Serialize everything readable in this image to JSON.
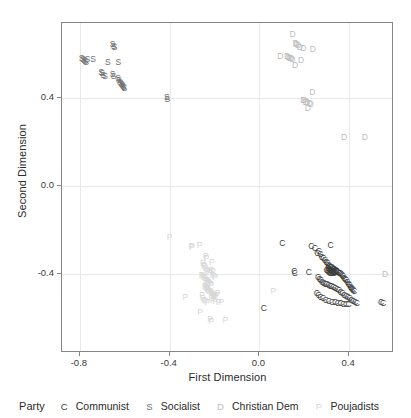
{
  "chart_data": {
    "type": "scatter",
    "title": "",
    "xlabel": "First Dimension",
    "ylabel": "Second Dimension",
    "xlim": [
      -0.88,
      0.6
    ],
    "ylim": [
      -0.76,
      0.74
    ],
    "xticks": [
      -0.8,
      -0.4,
      0.0,
      0.4
    ],
    "xticklabels": [
      "-0.8",
      "-0.4",
      "0.0",
      "0.4"
    ],
    "yticks": [
      0.4,
      0.0,
      -0.4
    ],
    "yticklabels": [
      "0.4",
      "0.0",
      "-0.4"
    ],
    "grid": true,
    "legend_position": "bottom",
    "legend_title": "Party",
    "series": [
      {
        "name": "Communist",
        "key": "C",
        "color": "#3c3c3c",
        "points": [
          [
            0.102,
            -0.262
          ],
          [
            0.317,
            -0.271
          ],
          [
            0.232,
            -0.273
          ],
          [
            0.247,
            -0.283
          ],
          [
            0.265,
            -0.296
          ],
          [
            0.258,
            -0.305
          ],
          [
            0.272,
            -0.311
          ],
          [
            0.278,
            -0.322
          ],
          [
            0.285,
            -0.33
          ],
          [
            0.292,
            -0.337
          ],
          [
            0.298,
            -0.344
          ],
          [
            0.303,
            -0.352
          ],
          [
            0.308,
            -0.358
          ],
          [
            0.313,
            -0.363
          ],
          [
            0.318,
            -0.367
          ],
          [
            0.322,
            -0.371
          ],
          [
            0.326,
            -0.374
          ],
          [
            0.33,
            -0.377
          ],
          [
            0.333,
            -0.379
          ],
          [
            0.336,
            -0.381
          ],
          [
            0.339,
            -0.383
          ],
          [
            0.341,
            -0.385
          ],
          [
            0.344,
            -0.386
          ],
          [
            0.306,
            -0.372
          ],
          [
            0.311,
            -0.377
          ],
          [
            0.315,
            -0.381
          ],
          [
            0.319,
            -0.384
          ],
          [
            0.323,
            -0.387
          ],
          [
            0.327,
            -0.389
          ],
          [
            0.331,
            -0.39
          ],
          [
            0.335,
            -0.391
          ],
          [
            0.338,
            -0.392
          ],
          [
            0.3,
            -0.384
          ],
          [
            0.305,
            -0.388
          ],
          [
            0.31,
            -0.392
          ],
          [
            0.315,
            -0.395
          ],
          [
            0.32,
            -0.397
          ],
          [
            0.326,
            -0.398
          ],
          [
            0.332,
            -0.398
          ],
          [
            0.345,
            -0.389
          ],
          [
            0.35,
            -0.391
          ],
          [
            0.355,
            -0.394
          ],
          [
            0.36,
            -0.398
          ],
          [
            0.364,
            -0.402
          ],
          [
            0.368,
            -0.407
          ],
          [
            0.372,
            -0.412
          ],
          [
            0.377,
            -0.418
          ],
          [
            0.382,
            -0.424
          ],
          [
            0.387,
            -0.43
          ],
          [
            0.392,
            -0.437
          ],
          [
            0.397,
            -0.444
          ],
          [
            0.402,
            -0.451
          ],
          [
            0.406,
            -0.458
          ],
          [
            0.41,
            -0.463
          ],
          [
            0.414,
            -0.468
          ],
          [
            0.418,
            -0.472
          ],
          [
            0.422,
            -0.476
          ],
          [
            0.156,
            -0.388
          ],
          [
            0.158,
            -0.397
          ],
          [
            0.22,
            -0.393
          ],
          [
            0.262,
            -0.415
          ],
          [
            0.268,
            -0.423
          ],
          [
            0.274,
            -0.43
          ],
          [
            0.28,
            -0.436
          ],
          [
            0.287,
            -0.441
          ],
          [
            0.294,
            -0.444
          ],
          [
            0.301,
            -0.447
          ],
          [
            0.308,
            -0.45
          ],
          [
            0.315,
            -0.453
          ],
          [
            0.322,
            -0.456
          ],
          [
            0.33,
            -0.459
          ],
          [
            0.338,
            -0.463
          ],
          [
            0.346,
            -0.468
          ],
          [
            0.354,
            -0.474
          ],
          [
            0.362,
            -0.481
          ],
          [
            0.37,
            -0.488
          ],
          [
            0.378,
            -0.495
          ],
          [
            0.386,
            -0.501
          ],
          [
            0.394,
            -0.507
          ],
          [
            0.402,
            -0.512
          ],
          [
            0.41,
            -0.517
          ],
          [
            0.418,
            -0.522
          ],
          [
            0.426,
            -0.527
          ],
          [
            0.434,
            -0.532
          ],
          [
            0.256,
            -0.487
          ],
          [
            0.264,
            -0.496
          ],
          [
            0.273,
            -0.504
          ],
          [
            0.284,
            -0.512
          ],
          [
            0.296,
            -0.518
          ],
          [
            0.31,
            -0.524
          ],
          [
            0.324,
            -0.528
          ],
          [
            0.337,
            -0.53
          ],
          [
            0.35,
            -0.532
          ],
          [
            0.362,
            -0.534
          ],
          [
            0.374,
            -0.536
          ],
          [
            0.386,
            -0.537
          ],
          [
            0.398,
            -0.538
          ],
          [
            0.542,
            -0.53
          ],
          [
            0.552,
            -0.531
          ],
          [
            0.02,
            -0.555
          ]
        ]
      },
      {
        "name": "Socialist",
        "key": "S",
        "color": "#6e6e6e",
        "points": [
          [
            -0.655,
            0.645
          ],
          [
            -0.65,
            0.636
          ],
          [
            -0.645,
            0.63
          ],
          [
            -0.792,
            0.582
          ],
          [
            -0.787,
            0.576
          ],
          [
            -0.782,
            0.57
          ],
          [
            -0.777,
            0.566
          ],
          [
            -0.772,
            0.562
          ],
          [
            -0.767,
            0.575
          ],
          [
            -0.742,
            0.575
          ],
          [
            -0.676,
            0.565
          ],
          [
            -0.629,
            0.563
          ],
          [
            -0.706,
            0.519
          ],
          [
            -0.701,
            0.511
          ],
          [
            -0.696,
            0.505
          ],
          [
            -0.688,
            0.499
          ],
          [
            -0.654,
            0.51
          ],
          [
            -0.65,
            0.5
          ],
          [
            -0.63,
            0.492
          ],
          [
            -0.627,
            0.483
          ],
          [
            -0.622,
            0.474
          ],
          [
            -0.618,
            0.468
          ],
          [
            -0.614,
            0.463
          ],
          [
            -0.611,
            0.458
          ],
          [
            -0.608,
            0.453
          ],
          [
            -0.605,
            0.449
          ],
          [
            -0.602,
            0.445
          ],
          [
            -0.413,
            0.402
          ],
          [
            -0.41,
            0.396
          ]
        ]
      },
      {
        "name": "Christian Dem",
        "key": "D",
        "color": "#bdbdbd",
        "points": [
          [
            0.148,
            0.69
          ],
          [
            0.162,
            0.65
          ],
          [
            0.166,
            0.643
          ],
          [
            0.172,
            0.638
          ],
          [
            0.18,
            0.632
          ],
          [
            0.196,
            0.627
          ],
          [
            0.238,
            0.62
          ],
          [
            0.093,
            0.589
          ],
          [
            0.124,
            0.59
          ],
          [
            0.13,
            0.586
          ],
          [
            0.136,
            0.582
          ],
          [
            0.141,
            0.58
          ],
          [
            0.147,
            0.578
          ],
          [
            0.186,
            0.57
          ],
          [
            0.159,
            0.548
          ],
          [
            0.236,
            0.425
          ],
          [
            0.196,
            0.392
          ],
          [
            0.202,
            0.388
          ],
          [
            0.206,
            0.383
          ],
          [
            0.212,
            0.38
          ],
          [
            0.224,
            0.378
          ],
          [
            0.229,
            0.374
          ],
          [
            0.216,
            0.356
          ],
          [
            0.378,
            0.221
          ],
          [
            0.47,
            0.222
          ],
          [
            0.56,
            -0.402
          ]
        ]
      },
      {
        "name": "Poujadists",
        "key": "P",
        "color": "#d6d6d6",
        "points": [
          [
            -0.4,
            -0.232
          ],
          [
            -0.303,
            -0.272
          ],
          [
            -0.3,
            -0.276
          ],
          [
            -0.266,
            -0.271
          ],
          [
            -0.24,
            -0.318
          ],
          [
            -0.236,
            -0.326
          ],
          [
            -0.252,
            -0.35
          ],
          [
            -0.248,
            -0.358
          ],
          [
            -0.244,
            -0.364
          ],
          [
            -0.212,
            -0.344
          ],
          [
            -0.24,
            -0.372
          ],
          [
            -0.236,
            -0.382
          ],
          [
            -0.23,
            -0.389
          ],
          [
            -0.222,
            -0.393
          ],
          [
            -0.214,
            -0.382
          ],
          [
            -0.206,
            -0.385
          ],
          [
            -0.258,
            -0.404
          ],
          [
            -0.252,
            -0.41
          ],
          [
            -0.246,
            -0.416
          ],
          [
            -0.242,
            -0.421
          ],
          [
            -0.238,
            -0.426
          ],
          [
            -0.234,
            -0.43
          ],
          [
            -0.23,
            -0.434
          ],
          [
            -0.226,
            -0.438
          ],
          [
            -0.222,
            -0.442
          ],
          [
            -0.218,
            -0.446
          ],
          [
            -0.214,
            -0.45
          ],
          [
            -0.208,
            -0.404
          ],
          [
            -0.202,
            -0.408
          ],
          [
            -0.196,
            -0.413
          ],
          [
            -0.244,
            -0.455
          ],
          [
            -0.24,
            -0.46
          ],
          [
            -0.236,
            -0.464
          ],
          [
            -0.232,
            -0.468
          ],
          [
            -0.228,
            -0.472
          ],
          [
            -0.224,
            -0.476
          ],
          [
            -0.22,
            -0.48
          ],
          [
            -0.216,
            -0.484
          ],
          [
            -0.212,
            -0.488
          ],
          [
            -0.208,
            -0.492
          ],
          [
            -0.204,
            -0.496
          ],
          [
            -0.2,
            -0.5
          ],
          [
            -0.196,
            -0.504
          ],
          [
            -0.19,
            -0.496
          ],
          [
            -0.186,
            -0.488
          ],
          [
            -0.33,
            -0.503
          ],
          [
            -0.256,
            -0.496
          ],
          [
            -0.252,
            -0.508
          ],
          [
            -0.247,
            -0.517
          ],
          [
            -0.24,
            -0.524
          ],
          [
            -0.232,
            -0.53
          ],
          [
            -0.214,
            -0.51
          ],
          [
            -0.206,
            -0.518
          ],
          [
            -0.198,
            -0.524
          ],
          [
            -0.182,
            -0.53
          ],
          [
            -0.17,
            -0.528
          ],
          [
            -0.264,
            -0.574
          ],
          [
            -0.22,
            -0.604
          ],
          [
            -0.214,
            -0.614
          ],
          [
            -0.152,
            -0.612
          ],
          [
            0.062,
            -0.478
          ]
        ]
      }
    ]
  },
  "axes": {
    "x_title": "First Dimension",
    "y_title": "Second Dimension"
  },
  "legend": {
    "title": "Party",
    "entries": [
      {
        "key": "C",
        "label": "Communist",
        "color": "#3c3c3c"
      },
      {
        "key": "S",
        "label": "Socialist",
        "color": "#6e6e6e"
      },
      {
        "key": "D",
        "label": "Christian Dem",
        "color": "#bdbdbd"
      },
      {
        "key": "P",
        "label": "Poujadists",
        "color": "#d6d6d6"
      }
    ]
  }
}
